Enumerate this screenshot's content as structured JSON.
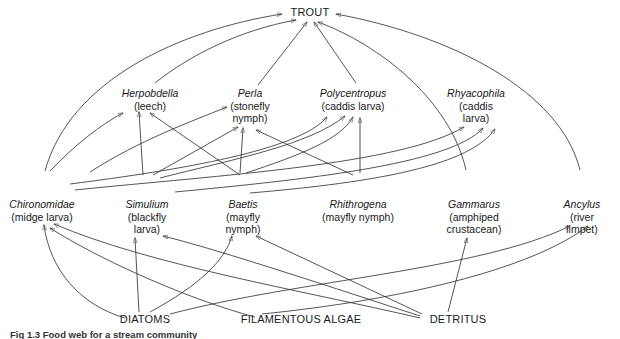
{
  "figure": {
    "caption": "Fig 1.3 Food web for a stream community"
  },
  "nodes": {
    "trout": {
      "label": "TROUT"
    },
    "herpobdella": {
      "genus": "Herpobdella",
      "common": "(leech)"
    },
    "perla": {
      "genus": "Perla",
      "common": "(stonefly\nnymph)"
    },
    "polycentropus": {
      "genus": "Polycentropus",
      "common": "(caddis larva)"
    },
    "rhyacophila": {
      "genus": "Rhyacophila",
      "common": "(caddis\nlarva)"
    },
    "chironomidae": {
      "genus": "Chironomidae",
      "common": "(midge larva)"
    },
    "simulium": {
      "genus": "Simulium",
      "common": "(blackfly\nlarva)"
    },
    "baetis": {
      "genus": "Baetis",
      "common": "(mayfly\nnymph)"
    },
    "rhithrogena": {
      "genus": "Rhithrogena",
      "common": "(mayfly nymph)"
    },
    "gammarus": {
      "genus": "Gammarus",
      "common": "(amphiped\ncrustacean)"
    },
    "ancylus": {
      "genus": "Ancylus",
      "common": "(river limpet)"
    },
    "diatoms": {
      "label": "DIATOMS"
    },
    "algae": {
      "label": "FILAMENTOUS ALGAE"
    },
    "detritus": {
      "label": "DETRITUS"
    }
  },
  "edges": [
    {
      "from": "chironomidae",
      "to": "trout"
    },
    {
      "from": "herpobdella",
      "to": "trout"
    },
    {
      "from": "perla",
      "to": "trout"
    },
    {
      "from": "polycentropus",
      "to": "trout"
    },
    {
      "from": "gammarus",
      "to": "trout"
    },
    {
      "from": "ancylus",
      "to": "trout"
    },
    {
      "from": "chironomidae",
      "to": "herpobdella"
    },
    {
      "from": "simulium",
      "to": "herpobdella"
    },
    {
      "from": "baetis",
      "to": "herpobdella"
    },
    {
      "from": "chironomidae",
      "to": "perla"
    },
    {
      "from": "simulium",
      "to": "perla"
    },
    {
      "from": "baetis",
      "to": "perla"
    },
    {
      "from": "rhithrogena",
      "to": "perla"
    },
    {
      "from": "chironomidae",
      "to": "polycentropus"
    },
    {
      "from": "simulium",
      "to": "polycentropus"
    },
    {
      "from": "baetis",
      "to": "polycentropus"
    },
    {
      "from": "rhithrogena",
      "to": "polycentropus"
    },
    {
      "from": "chironomidae",
      "to": "rhyacophila"
    },
    {
      "from": "simulium",
      "to": "rhyacophila"
    },
    {
      "from": "baetis",
      "to": "rhyacophila"
    },
    {
      "from": "diatoms",
      "to": "chironomidae"
    },
    {
      "from": "diatoms",
      "to": "simulium"
    },
    {
      "from": "diatoms",
      "to": "baetis"
    },
    {
      "from": "diatoms",
      "to": "ancylus"
    },
    {
      "from": "algae",
      "to": "chironomidae"
    },
    {
      "from": "algae",
      "to": "ancylus"
    },
    {
      "from": "detritus",
      "to": "chironomidae"
    },
    {
      "from": "detritus",
      "to": "simulium"
    },
    {
      "from": "detritus",
      "to": "baetis"
    },
    {
      "from": "detritus",
      "to": "gammarus"
    }
  ]
}
